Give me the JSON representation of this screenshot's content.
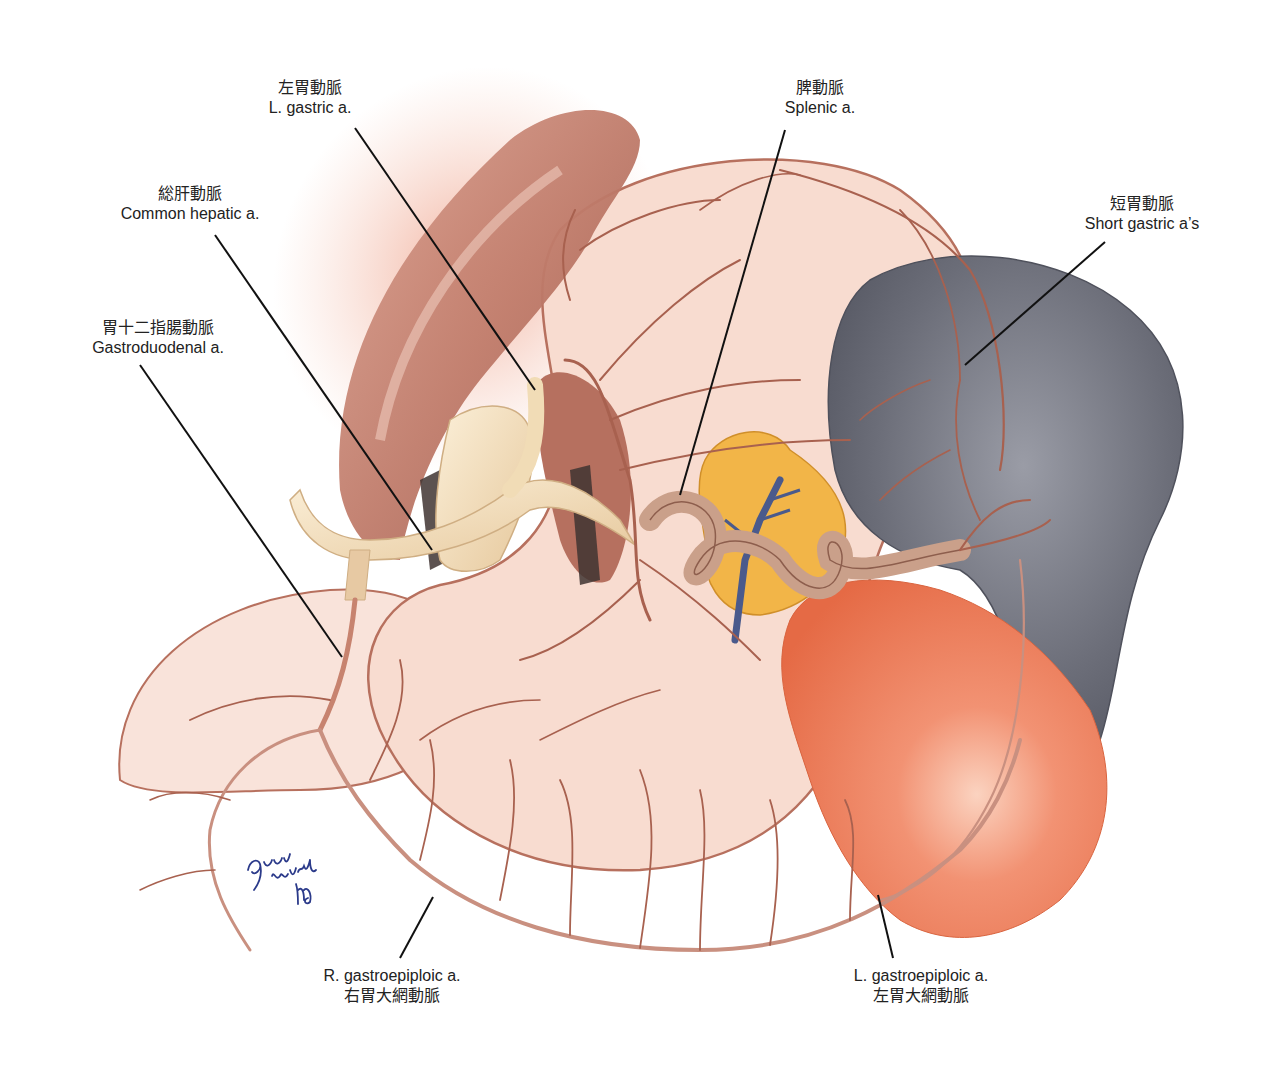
{
  "figure": {
    "colors": {
      "background": "#ffffff",
      "stomach_fill": "#f8dcd0",
      "stomach_outline": "#b7705e",
      "artery": "#a8614f",
      "artery_light": "#d9a89a",
      "muscle": "#c98776",
      "muscle_dark": "#a45f51",
      "liver_glow": "#f3b8a6",
      "hepatic_trunk": "#f1dcb6",
      "pancreas": "#f2b548",
      "pancreas_vein": "#4a5a8c",
      "splenic_artery": "#caa08a",
      "spleen": "#6b6d78",
      "spleen_highlight": "#9a9ca6",
      "kidney_orange": "#ee7b58",
      "leader_line": "#111111",
      "signature_ink": "#2b3a8a"
    }
  },
  "labels": [
    {
      "id": "left-gastric",
      "jp": "左胃動脈",
      "en": "L. gastric a."
    },
    {
      "id": "splenic",
      "jp": "脾動脈",
      "en": "Splenic a."
    },
    {
      "id": "common-hepatic",
      "jp": "総肝動脈",
      "en": "Common hepatic a."
    },
    {
      "id": "short-gastric",
      "jp": "短胃動脈",
      "en": "Short gastric a’s"
    },
    {
      "id": "gastroduodenal",
      "jp": "胃十二指腸動脈",
      "en": "Gastroduodenal a."
    },
    {
      "id": "right-gastroepiploic",
      "en": "R. gastroepiploic a.",
      "jp": "右胃大網動脈"
    },
    {
      "id": "left-gastroepiploic",
      "en": "L. gastroepiploic a.",
      "jp": "左胃大網動脈"
    }
  ],
  "signature": {
    "text": "Gary Wind MD"
  }
}
